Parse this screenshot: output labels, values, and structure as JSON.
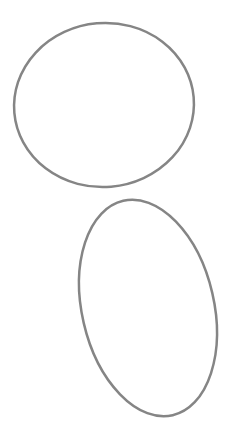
{
  "canvas": {
    "width": 235,
    "height": 437,
    "background": "#ffffff"
  },
  "shapes": [
    {
      "type": "ellipse",
      "name": "ellipse-top",
      "cx": 104,
      "cy": 105,
      "rx": 90,
      "ry": 82,
      "rotate": -5,
      "stroke": "#858585",
      "stroke_width": 2.5,
      "fill": "none"
    },
    {
      "type": "ellipse",
      "name": "ellipse-bottom",
      "cx": 148,
      "cy": 308,
      "rx": 66,
      "ry": 110,
      "rotate": -13,
      "stroke": "#858585",
      "stroke_width": 2.5,
      "fill": "none"
    }
  ]
}
